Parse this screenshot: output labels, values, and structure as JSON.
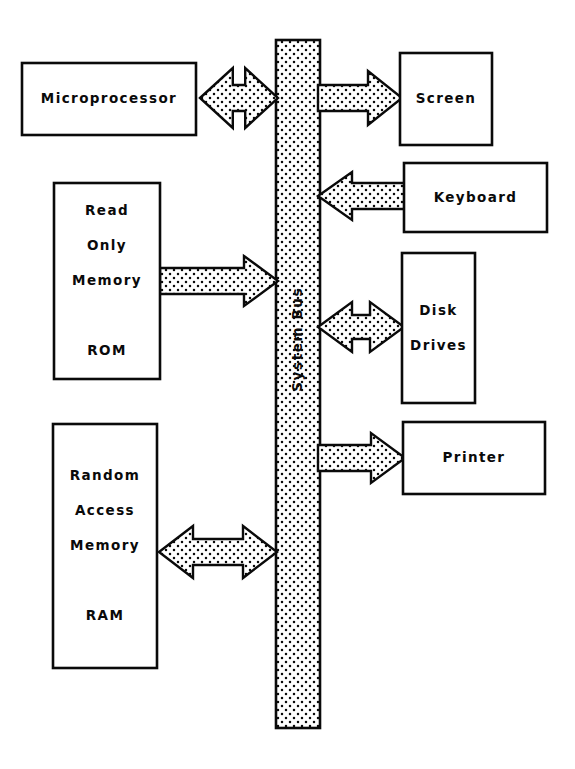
{
  "diagram": {
    "type": "block-diagram",
    "canvas": {
      "width": 575,
      "height": 769
    },
    "colors": {
      "background": "#ffffff",
      "stroke": "#0a0a0a",
      "box_fill": "#ffffff",
      "stipple_fill": "#f2f2f2",
      "stipple_dot": "#0a0a0a"
    },
    "bus": {
      "name": "system-bus",
      "label": "System Bus",
      "orientation": "vertical",
      "text_rotation_deg": -90,
      "x": 276,
      "y": 40,
      "width": 44,
      "height": 688,
      "fill": "stipple"
    },
    "boxes": [
      {
        "id": "microprocessor",
        "lines": [
          "Microprocessor"
        ],
        "x": 22,
        "y": 63,
        "width": 174,
        "height": 72,
        "side": "left"
      },
      {
        "id": "rom",
        "lines": [
          "Read",
          "Only",
          "Memory",
          "",
          "ROM"
        ],
        "x": 54,
        "y": 183,
        "width": 106,
        "height": 196,
        "side": "left"
      },
      {
        "id": "ram",
        "lines": [
          "Random",
          "Access",
          "Memory",
          "",
          "RAM"
        ],
        "x": 53,
        "y": 424,
        "width": 104,
        "height": 244,
        "side": "left"
      },
      {
        "id": "screen",
        "lines": [
          "Screen"
        ],
        "x": 400,
        "y": 53,
        "width": 92,
        "height": 92,
        "side": "right"
      },
      {
        "id": "keyboard",
        "lines": [
          "Keyboard"
        ],
        "x": 404,
        "y": 163,
        "width": 143,
        "height": 69,
        "side": "right"
      },
      {
        "id": "disk-drives",
        "lines": [
          "Disk",
          "Drives"
        ],
        "x": 402,
        "y": 253,
        "width": 73,
        "height": 150,
        "side": "right"
      },
      {
        "id": "printer",
        "lines": [
          "Printer"
        ],
        "x": 403,
        "y": 422,
        "width": 142,
        "height": 72,
        "side": "right"
      }
    ],
    "arrows": [
      {
        "id": "microprocessor-bus-arrow",
        "from": "microprocessor",
        "to": "system-bus",
        "direction": "both",
        "x1": 200,
        "x2": 278,
        "cy": 98,
        "shaft_half": 13,
        "head_half": 30
      },
      {
        "id": "rom-bus-arrow",
        "from": "rom",
        "to": "system-bus",
        "direction": "right",
        "x1": 160,
        "x2": 278,
        "cy": 281,
        "shaft_half": 13,
        "head_half": 25
      },
      {
        "id": "ram-bus-arrow",
        "from": "ram",
        "to": "system-bus",
        "direction": "both",
        "x1": 159,
        "x2": 277,
        "cy": 552,
        "shaft_half": 13,
        "head_half": 26
      },
      {
        "id": "bus-screen-arrow",
        "from": "system-bus",
        "to": "screen",
        "direction": "right",
        "x1": 318,
        "x2": 402,
        "cy": 98,
        "shaft_half": 13,
        "head_half": 27
      },
      {
        "id": "keyboard-bus-arrow",
        "from": "keyboard",
        "to": "system-bus",
        "direction": "left",
        "x1": 318,
        "x2": 406,
        "cy": 196,
        "shaft_half": 13,
        "head_half": 24
      },
      {
        "id": "bus-disk-drives-arrow",
        "from": "system-bus",
        "to": "disk-drives",
        "direction": "both",
        "x1": 318,
        "x2": 404,
        "cy": 327,
        "shaft_half": 12,
        "head_half": 25
      },
      {
        "id": "bus-printer-arrow",
        "from": "system-bus",
        "to": "printer",
        "direction": "right",
        "x1": 318,
        "x2": 405,
        "cy": 458,
        "shaft_half": 13,
        "head_half": 25
      }
    ]
  }
}
